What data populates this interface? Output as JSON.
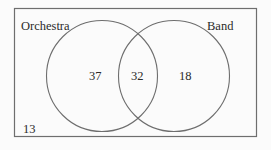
{
  "diagram": {
    "type": "venn",
    "sets": [
      {
        "name": "Orchestra",
        "label": "Orchestra",
        "only_count": "37"
      },
      {
        "name": "Band",
        "label": "Band",
        "only_count": "18"
      }
    ],
    "intersection_count": "32",
    "outside_count": "13",
    "colors": {
      "stroke": "#6e6e6e",
      "text": "#2a2a2a",
      "background": "#fbfbfb"
    }
  }
}
